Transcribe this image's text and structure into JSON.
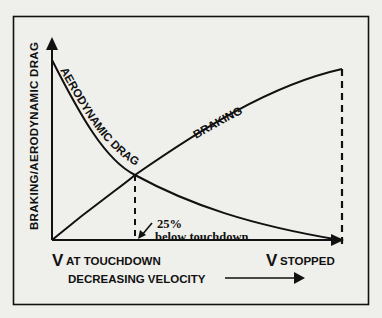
{
  "diagram": {
    "y_axis_label": "BRAKING/AERODYNAMIC DRAG",
    "x_axis_label": "DECREASING VELOCITY",
    "x_start_label": {
      "v": "V",
      "text": "AT TOUCHDOWN"
    },
    "x_end_label": {
      "v": "V",
      "text": "STOPPED"
    },
    "curves": [
      {
        "name": "aerodynamic-drag",
        "label": "AERODYNAMIC DRAG",
        "trend": "decreasing"
      },
      {
        "name": "braking",
        "label": "BRAKING",
        "trend": "increasing"
      }
    ],
    "annotation": {
      "line1": "25%",
      "line2": "below touchdown"
    },
    "colors": {
      "ink": "#111111",
      "background": "#efefeb"
    }
  }
}
